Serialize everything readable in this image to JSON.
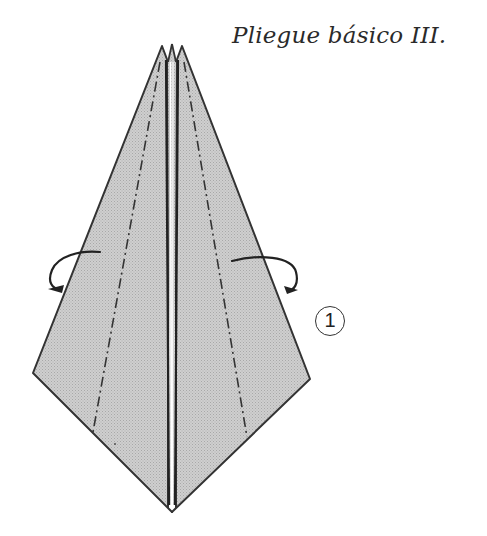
{
  "title": "Pliegue básico III.",
  "step_number": "1",
  "colors": {
    "paper_fill": "#c4c4c4",
    "line": "#333333",
    "background": "#ffffff"
  },
  "icons": {
    "left_arrow": "curved-fold-arrow-left",
    "right_arrow": "curved-fold-arrow-right"
  }
}
